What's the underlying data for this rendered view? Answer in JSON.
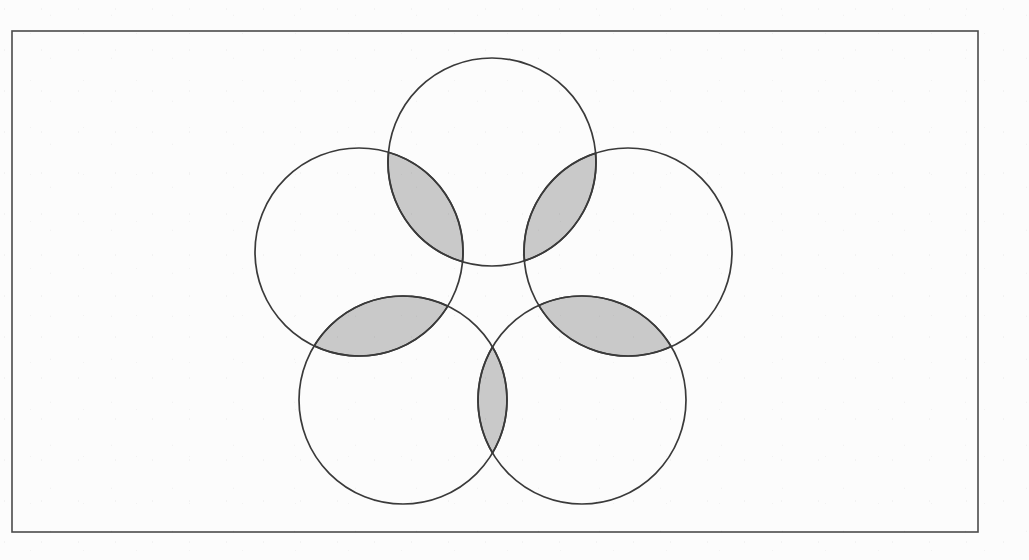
{
  "figure": {
    "canvas": {
      "width": 1029,
      "height": 560,
      "background": "#fcfcfc"
    },
    "frame": {
      "name": "outer-rectangle-border",
      "x": 12,
      "y": 31,
      "width": 966,
      "height": 501,
      "stroke": "#4a4a4a",
      "stroke_width": 1.6,
      "fill": "none"
    },
    "style": {
      "circle_stroke": "#3a3a3a",
      "circle_stroke_width": 1.7,
      "circle_fill": "none",
      "lens_fill": "#c9c9c9",
      "lens_stroke": "#3a3a3a",
      "lens_stroke_width": 1.7
    },
    "geometry": {
      "arrangement": "regular-pentagon",
      "center": {
        "x": 492,
        "y": 300
      },
      "circumradius": 141,
      "circle_radius": 104,
      "circle_count": 5,
      "lens_count": 5,
      "rotation_deg": -90
    },
    "circles": [
      {
        "id": "circle-top",
        "label": "Top circle",
        "cx": 492,
        "cy": 162,
        "r": 104
      },
      {
        "id": "circle-upper-right",
        "label": "Upper-right circle",
        "cx": 628,
        "cy": 252,
        "r": 104
      },
      {
        "id": "circle-lower-right",
        "label": "Lower-right circle",
        "cx": 582,
        "cy": 400,
        "r": 104
      },
      {
        "id": "circle-lower-left",
        "label": "Lower-left circle",
        "cx": 403,
        "cy": 400,
        "r": 104
      },
      {
        "id": "circle-upper-left",
        "label": "Upper-left circle",
        "cx": 359,
        "cy": 252,
        "r": 104
      }
    ],
    "lenses": [
      {
        "id": "lens-top-upper-left",
        "label": "Shaded overlap: top and upper-left",
        "a": "circle-top",
        "b": "circle-upper-left"
      },
      {
        "id": "lens-top-upper-right",
        "label": "Shaded overlap: top and upper-right",
        "a": "circle-top",
        "b": "circle-upper-right"
      },
      {
        "id": "lens-upper-left-lower-left",
        "label": "Shaded overlap: upper-left and lower-left",
        "a": "circle-upper-left",
        "b": "circle-lower-left"
      },
      {
        "id": "lens-upper-right-lower-right",
        "label": "Shaded overlap: upper-right and lower-right",
        "a": "circle-upper-right",
        "b": "circle-lower-right"
      },
      {
        "id": "lens-lower-left-lower-right",
        "label": "Shaded overlap: lower-left and lower-right",
        "a": "circle-lower-left",
        "b": "circle-lower-right"
      }
    ]
  }
}
